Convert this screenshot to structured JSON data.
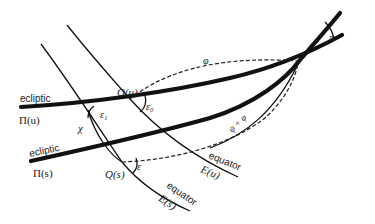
{
  "labels": {
    "ecliptic_u": "ecliptic",
    "ecliptic_u_symbol": "Π(u)",
    "ecliptic_s": "ecliptic",
    "ecliptic_s_symbol": "Π(s)",
    "equator_u": "equator",
    "equator_u_symbol": "E(u)",
    "equator_s": "equator",
    "equator_s_symbol": "E(s)",
    "node_u": "Q(u)",
    "node_s": "Q(s)",
    "angle_eps0": "ε₀",
    "angle_eps1": "ε₁",
    "angle_eps": "ε",
    "angle_chi": "χ",
    "arc_phi": "φ",
    "arc_psi_phi": "ψ + φ",
    "angle_pi": "π"
  }
}
